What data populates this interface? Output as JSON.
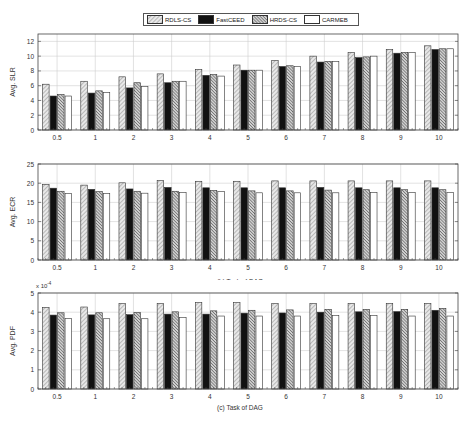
{
  "legend": {
    "items": [
      {
        "label": "RDLS-CS",
        "pattern": "light-diagonal"
      },
      {
        "label": "FastCEED",
        "pattern": "solid-black"
      },
      {
        "label": "HRDS-CS",
        "pattern": "dense-diagonal"
      },
      {
        "label": "CARMEB",
        "pattern": "white"
      }
    ]
  },
  "chart_data": [
    {
      "type": "bar",
      "title": "(a) Task of DAG",
      "xlabel": "(a) Task of DAG",
      "ylabel": "Avg. SLR",
      "ylim": [
        0,
        13
      ],
      "yticks": [
        0,
        2,
        4,
        6,
        8,
        10,
        12
      ],
      "grid": true,
      "legend_position": "top-center",
      "categories": [
        "0.5",
        "1",
        "2",
        "3",
        "4",
        "5",
        "6",
        "7",
        "8",
        "9",
        "10"
      ],
      "series": [
        {
          "name": "RDLS-CS",
          "values": [
            6.2,
            6.6,
            7.2,
            7.6,
            8.2,
            8.8,
            9.4,
            10.0,
            10.5,
            10.9,
            11.4
          ]
        },
        {
          "name": "FastCEED",
          "values": [
            4.6,
            5.0,
            5.7,
            6.4,
            7.4,
            8.1,
            8.6,
            9.2,
            9.8,
            10.4,
            10.9
          ]
        },
        {
          "name": "HRDS-CS",
          "values": [
            4.8,
            5.3,
            6.4,
            6.6,
            7.5,
            8.1,
            8.7,
            9.3,
            9.9,
            10.5,
            11.0
          ]
        },
        {
          "name": "CARMEB",
          "values": [
            4.6,
            5.1,
            5.9,
            6.6,
            7.3,
            8.1,
            8.6,
            9.3,
            10.0,
            10.5,
            11.0
          ]
        }
      ]
    },
    {
      "type": "bar",
      "title": "(b) Task of DAG",
      "xlabel": "(b) Task of DAG",
      "ylabel": "Avg. ECR",
      "ylim": [
        0,
        25
      ],
      "yticks": [
        0,
        5,
        10,
        15,
        20,
        25
      ],
      "grid": true,
      "categories": [
        "0.5",
        "1",
        "2",
        "3",
        "4",
        "5",
        "6",
        "7",
        "8",
        "9",
        "10"
      ],
      "series": [
        {
          "name": "RDLS-CS",
          "values": [
            19.7,
            19.5,
            20.1,
            20.7,
            20.5,
            20.5,
            20.6,
            20.6,
            20.6,
            20.6,
            20.6
          ]
        },
        {
          "name": "FastCEED",
          "values": [
            18.7,
            18.4,
            18.5,
            18.9,
            18.8,
            18.8,
            18.8,
            18.9,
            18.8,
            18.8,
            18.8
          ]
        },
        {
          "name": "HRDS-CS",
          "values": [
            17.9,
            17.8,
            17.9,
            17.9,
            18.1,
            18.0,
            18.0,
            18.2,
            18.3,
            18.3,
            18.3
          ]
        },
        {
          "name": "CARMEB",
          "values": [
            17.3,
            17.3,
            17.4,
            17.6,
            17.8,
            17.5,
            17.5,
            17.5,
            17.6,
            17.6,
            17.6
          ]
        }
      ]
    },
    {
      "type": "bar",
      "title": "(c) Task of DAG",
      "xlabel": "(c) Task of DAG",
      "ylabel": "Avg. PDF",
      "y_multiplier": "x 10",
      "y_multiplier_exp": "-4",
      "ylim": [
        0,
        5
      ],
      "yticks": [
        0,
        1,
        2,
        3,
        4,
        5
      ],
      "grid": true,
      "categories": [
        "0.5",
        "1",
        "2",
        "3",
        "4",
        "5",
        "6",
        "7",
        "8",
        "9",
        "10"
      ],
      "series": [
        {
          "name": "RDLS-CS",
          "values": [
            4.25,
            4.27,
            4.45,
            4.45,
            4.5,
            4.5,
            4.45,
            4.45,
            4.45,
            4.45,
            4.45
          ]
        },
        {
          "name": "FastCEED",
          "values": [
            3.85,
            3.86,
            3.87,
            3.9,
            3.9,
            3.95,
            3.96,
            4.0,
            4.02,
            4.03,
            4.1
          ]
        },
        {
          "name": "HRDS-CS",
          "values": [
            3.97,
            3.97,
            3.98,
            4.02,
            4.07,
            4.1,
            4.12,
            4.15,
            4.15,
            4.15,
            4.2
          ]
        },
        {
          "name": "CARMEB",
          "values": [
            3.67,
            3.66,
            3.66,
            3.72,
            3.8,
            3.8,
            3.8,
            3.82,
            3.82,
            3.8,
            3.8
          ]
        }
      ]
    }
  ]
}
